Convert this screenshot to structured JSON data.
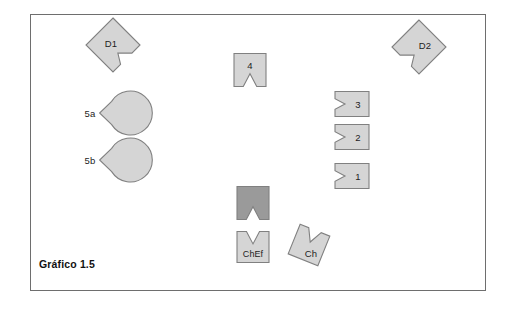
{
  "figure": {
    "caption": "Gráfico 1.5",
    "background_color": "#ffffff",
    "frame_color": "#6e6e6e",
    "shape_fill_light": "#d5d5d5",
    "shape_fill_dark": "#9a9a9a",
    "shape_stroke": "#808080"
  },
  "shapes": [
    {
      "id": "d1",
      "label": "D1",
      "kind": "notched-diamond",
      "notch_side": "right",
      "fill": "#d5d5d5",
      "cx": 113,
      "cy": 45
    },
    {
      "id": "d2",
      "label": "D2",
      "kind": "notched-diamond",
      "notch_side": "left",
      "fill": "#d5d5d5",
      "cx": 419,
      "cy": 47
    },
    {
      "id": "c5a",
      "label": "5a",
      "kind": "notched-circle",
      "notch_side": "right",
      "fill": "#d5d5d5",
      "cx": 93,
      "cy": 113
    },
    {
      "id": "c5b",
      "label": "5b",
      "kind": "notched-circle",
      "notch_side": "right",
      "fill": "#d5d5d5",
      "cx": 93,
      "cy": 160
    },
    {
      "id": "r4",
      "label": "4",
      "kind": "notched-rect",
      "notch_side": "bottom",
      "fill": "#d5d5d5",
      "cx": 250,
      "cy": 70
    },
    {
      "id": "r3",
      "label": "3",
      "kind": "notched-rect",
      "notch_side": "left",
      "fill": "#d5d5d5",
      "cx": 352,
      "cy": 104
    },
    {
      "id": "r2",
      "label": "2",
      "kind": "notched-rect",
      "notch_side": "left",
      "fill": "#d5d5d5",
      "cx": 352,
      "cy": 137
    },
    {
      "id": "r1",
      "label": "1",
      "kind": "notched-rect",
      "notch_side": "left",
      "fill": "#d5d5d5",
      "cx": 352,
      "cy": 176
    },
    {
      "id": "dark",
      "label": "",
      "kind": "notched-rect",
      "notch_side": "bottom",
      "fill": "#9a9a9a",
      "cx": 253,
      "cy": 203
    },
    {
      "id": "chef",
      "label": "ChEf",
      "kind": "notched-rect",
      "notch_side": "top",
      "fill": "#d5d5d5",
      "cx": 253,
      "cy": 247
    },
    {
      "id": "ch",
      "label": "Ch",
      "kind": "notched-rect-rotated",
      "notch_side": "top",
      "fill": "#d5d5d5",
      "cx": 309,
      "cy": 245,
      "rotation_deg": 22
    }
  ]
}
